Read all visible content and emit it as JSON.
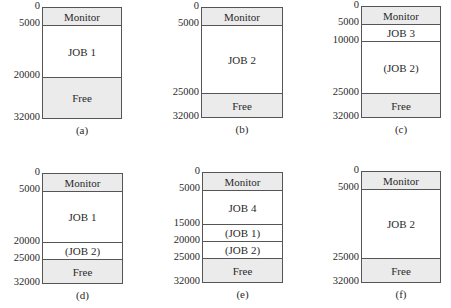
{
  "figure": {
    "total_memory": 32000,
    "diagrams": [
      {
        "id": "a",
        "caption": "(a)",
        "box": {
          "x": 42,
          "y": 7,
          "w": 80,
          "h": 112
        },
        "ticks": [
          "0",
          "5000",
          "20000",
          "32000"
        ],
        "tick_values": [
          0,
          5000,
          20000,
          32000
        ],
        "segments": [
          {
            "label": "Monitor",
            "start": 0,
            "end": 5000,
            "shaded": true
          },
          {
            "label": "JOB 1",
            "start": 5000,
            "end": 20000,
            "shaded": false
          },
          {
            "label": "Free",
            "start": 20000,
            "end": 32000,
            "shaded": true
          }
        ]
      },
      {
        "id": "b",
        "caption": "(b)",
        "box": {
          "x": 201,
          "y": 7,
          "w": 82,
          "h": 111
        },
        "ticks": [
          "0",
          "5000",
          "25000",
          "32000"
        ],
        "tick_values": [
          0,
          5000,
          25000,
          32000
        ],
        "segments": [
          {
            "label": "Monitor",
            "start": 0,
            "end": 5000,
            "shaded": true
          },
          {
            "label": "JOB 2",
            "start": 5000,
            "end": 25000,
            "shaded": false
          },
          {
            "label": "Free",
            "start": 25000,
            "end": 32000,
            "shaded": true
          }
        ]
      },
      {
        "id": "c",
        "caption": "(c)",
        "box": {
          "x": 361,
          "y": 6,
          "w": 80,
          "h": 112
        },
        "ticks": [
          "0",
          "5000",
          "10000",
          "25000",
          "32000"
        ],
        "tick_values": [
          0,
          5000,
          10000,
          25000,
          32000
        ],
        "segments": [
          {
            "label": "Monitor",
            "start": 0,
            "end": 5000,
            "shaded": true
          },
          {
            "label": "JOB 3",
            "start": 5000,
            "end": 10000,
            "shaded": false
          },
          {
            "label": "(JOB 2)",
            "start": 10000,
            "end": 25000,
            "shaded": false
          },
          {
            "label": "Free",
            "start": 25000,
            "end": 32000,
            "shaded": true
          }
        ]
      },
      {
        "id": "d",
        "caption": "(d)",
        "box": {
          "x": 42,
          "y": 173,
          "w": 81,
          "h": 111
        },
        "ticks": [
          "0",
          "5000",
          "20000",
          "25000",
          "32000"
        ],
        "tick_values": [
          0,
          5000,
          20000,
          25000,
          32000
        ],
        "segments": [
          {
            "label": "Monitor",
            "start": 0,
            "end": 5000,
            "shaded": true
          },
          {
            "label": "JOB 1",
            "start": 5000,
            "end": 20000,
            "shaded": false
          },
          {
            "label": "(JOB 2)",
            "start": 20000,
            "end": 25000,
            "shaded": false
          },
          {
            "label": "Free",
            "start": 25000,
            "end": 32000,
            "shaded": true
          }
        ]
      },
      {
        "id": "e",
        "caption": "(e)",
        "box": {
          "x": 202,
          "y": 172,
          "w": 81,
          "h": 111
        },
        "ticks": [
          "0",
          "5000",
          "15000",
          "20000",
          "25000",
          "32000"
        ],
        "tick_values": [
          0,
          5000,
          15000,
          20000,
          25000,
          32000
        ],
        "segments": [
          {
            "label": "Monitor",
            "start": 0,
            "end": 5000,
            "shaded": true
          },
          {
            "label": "JOB 4",
            "start": 5000,
            "end": 15000,
            "shaded": false
          },
          {
            "label": "(JOB 1)",
            "start": 15000,
            "end": 20000,
            "shaded": false
          },
          {
            "label": "(JOB 2)",
            "start": 20000,
            "end": 25000,
            "shaded": false
          },
          {
            "label": "Free",
            "start": 25000,
            "end": 32000,
            "shaded": true
          }
        ]
      },
      {
        "id": "f",
        "caption": "(f)",
        "box": {
          "x": 361,
          "y": 171,
          "w": 80,
          "h": 112
        },
        "ticks": [
          "0",
          "5000",
          "25000",
          "32000"
        ],
        "tick_values": [
          0,
          5000,
          25000,
          32000
        ],
        "segments": [
          {
            "label": "Monitor",
            "start": 0,
            "end": 5000,
            "shaded": true
          },
          {
            "label": "JOB 2",
            "start": 5000,
            "end": 25000,
            "shaded": false
          },
          {
            "label": "Free",
            "start": 25000,
            "end": 32000,
            "shaded": true
          }
        ]
      }
    ]
  },
  "colors": {
    "shaded": "#ebebeb",
    "border": "#555555",
    "text": "#2a2a2a"
  }
}
